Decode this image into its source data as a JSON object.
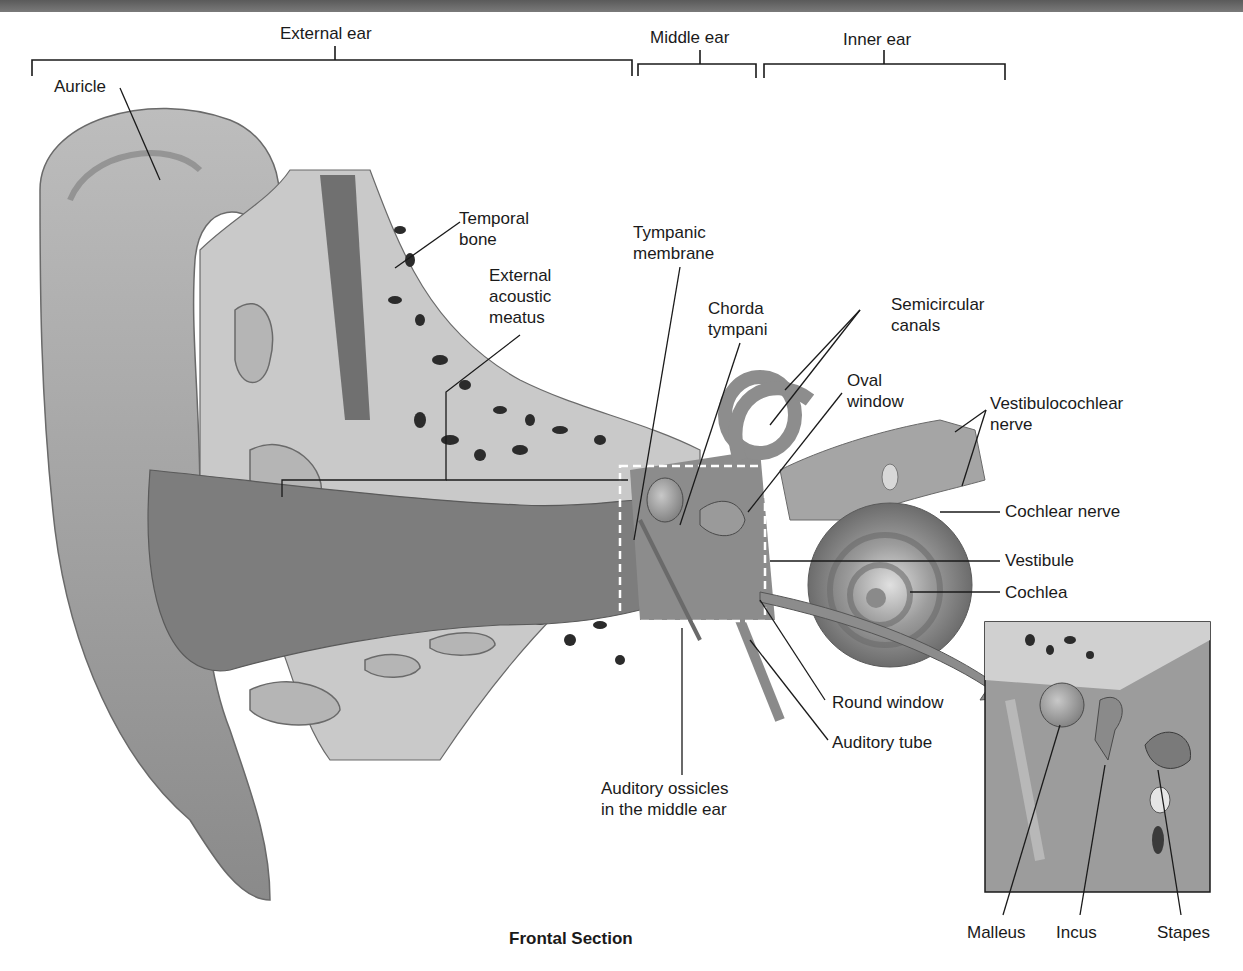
{
  "regions": {
    "external_ear": "External ear",
    "middle_ear": "Middle ear",
    "inner_ear": "Inner ear"
  },
  "labels": {
    "auricle": "Auricle",
    "temporal_bone": [
      "Temporal",
      "bone"
    ],
    "external_acoustic_meatus": [
      "External",
      "acoustic",
      "meatus"
    ],
    "tympanic_membrane": [
      "Tympanic",
      "membrane"
    ],
    "chorda_tympani": [
      "Chorda",
      "tympani"
    ],
    "semicircular_canals": [
      "Semicircular",
      "canals"
    ],
    "oval_window": [
      "Oval",
      "window"
    ],
    "vestibulocochlear_nerve": [
      "Vestibulocochlear",
      "nerve"
    ],
    "cochlear_nerve": "Cochlear nerve",
    "vestibule": "Vestibule",
    "cochlea": "Cochlea",
    "round_window": "Round window",
    "auditory_tube": "Auditory tube",
    "auditory_ossicles": [
      "Auditory ossicles",
      "in the middle ear"
    ]
  },
  "inset": {
    "malleus": "Malleus",
    "incus": "Incus",
    "stapes": "Stapes"
  },
  "caption": "Frontal Section",
  "colors": {
    "tissue": "#9a9a9a",
    "bone": "#cfcfcf",
    "dark": "#2b2b2b",
    "leader": "#1a1a1a"
  }
}
